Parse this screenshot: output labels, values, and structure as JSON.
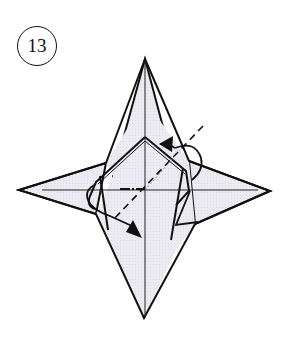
{
  "step": {
    "number": "13"
  },
  "diagram": {
    "colors": {
      "paper_fill": "#e9e9f0",
      "line": "#111111",
      "valley_line": "#111111"
    },
    "icons": {
      "fold-arrow-top": "curved fold arrow pointing left at top",
      "fold-arrow-bottom": "curved fold arrow pointing down-right at bottom",
      "valley-fold-line": "dashed diagonal fold line"
    }
  }
}
